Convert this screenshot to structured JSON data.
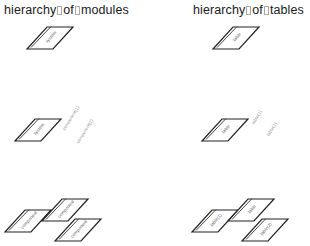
{
  "panels": [
    {
      "title_words": [
        "hierarchy",
        "of",
        "modules"
      ],
      "rows": [
        {
          "nodes": [
            {
              "label": "system"
            }
          ],
          "detached_labels": []
        },
        {
          "nodes": [
            {
              "label": "system"
            }
          ],
          "detached_labels": [
            {
              "label": "component(1)"
            },
            {
              "label": "component(2)"
            }
          ]
        },
        {
          "nodes": [
            {
              "label": "component"
            },
            {
              "label": "component"
            },
            {
              "label": "component"
            }
          ],
          "detached_labels": []
        }
      ]
    },
    {
      "title_words": [
        "hierarchy",
        "of",
        "tables"
      ],
      "rows": [
        {
          "nodes": [
            {
              "label": "table"
            }
          ],
          "detached_labels": []
        },
        {
          "nodes": [
            {
              "label": "table"
            }
          ],
          "detached_labels": [
            {
              "label": "table(1)"
            },
            {
              "label": "table(2)"
            }
          ]
        },
        {
          "nodes": [
            {
              "label": "table(1)"
            },
            {
              "label": "table"
            },
            {
              "label": "table(2)"
            }
          ],
          "detached_labels": []
        }
      ]
    }
  ]
}
